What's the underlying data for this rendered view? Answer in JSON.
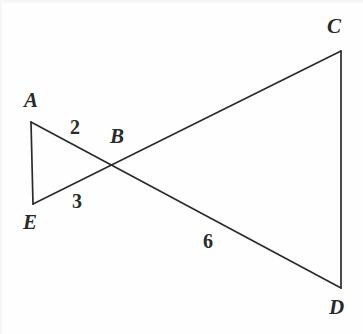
{
  "figure": {
    "type": "geometry-diagram",
    "background_color": "#fefefe",
    "stroke_color": "#2b2b2b",
    "text_color": "#2a2a2a",
    "canvas": {
      "width": 363,
      "height": 334
    },
    "vertices": [
      {
        "id": "A",
        "label": "A",
        "x": 31,
        "y": 122,
        "label_x": 24,
        "label_y": 90
      },
      {
        "id": "E",
        "label": "E",
        "x": 33,
        "y": 204,
        "label_x": 23,
        "label_y": 212
      },
      {
        "id": "B",
        "label": "B",
        "x": 111,
        "y": 166,
        "label_x": 110,
        "label_y": 126
      },
      {
        "id": "C",
        "label": "C",
        "x": 341,
        "y": 51,
        "label_x": 327,
        "label_y": 16
      },
      {
        "id": "D",
        "label": "D",
        "x": 341,
        "y": 288,
        "label_x": 329,
        "label_y": 297
      }
    ],
    "segments": [
      {
        "id": "AE",
        "from": "A",
        "to": "E",
        "x1": 31,
        "y1": 122,
        "x2": 33,
        "y2": 204
      },
      {
        "id": "AD",
        "from": "A",
        "to": "D",
        "x1": 31,
        "y1": 122,
        "x2": 341,
        "y2": 288
      },
      {
        "id": "EC",
        "from": "E",
        "to": "C",
        "x1": 33,
        "y1": 204,
        "x2": 341,
        "y2": 51
      },
      {
        "id": "CD",
        "from": "C",
        "to": "D",
        "x1": 341,
        "y1": 51,
        "x2": 341,
        "y2": 288
      }
    ],
    "measure_labels": [
      {
        "id": "m2",
        "text": "2",
        "x": 70,
        "y": 117,
        "near": "AB"
      },
      {
        "id": "m3",
        "text": "3",
        "x": 72,
        "y": 191,
        "near": "EB"
      },
      {
        "id": "m6",
        "text": "6",
        "x": 203,
        "y": 231,
        "near": "BD"
      }
    ]
  }
}
